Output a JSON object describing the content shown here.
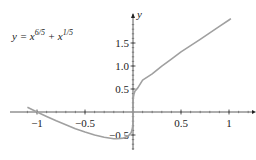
{
  "chart_data": {
    "type": "line",
    "title_parts": {
      "base": "y = x",
      "exp1": "6/5",
      "plus": " + x",
      "exp2": "1/5"
    },
    "xlabel": "",
    "ylabel": "y",
    "xlim": [
      -1.1,
      1.05
    ],
    "ylim": [
      -0.6,
      2.0
    ],
    "x_ticks": [
      -1,
      -0.5,
      0.5,
      1
    ],
    "x_tick_labels": [
      "−1",
      "−0.5",
      "0.5",
      "1"
    ],
    "y_ticks": [
      -0.5,
      0.5,
      1.0,
      1.5
    ],
    "y_tick_labels": [
      "−0.5",
      "0.5",
      "1.0",
      "1.5"
    ],
    "grid": false,
    "legend": null,
    "curve_color": "#a0a0a0",
    "axis_color": "#333333",
    "series": [
      {
        "name": "y = x^(6/5) + x^(1/5)",
        "x": [
          -1.1,
          -1.0,
          -0.9,
          -0.8,
          -0.7,
          -0.6,
          -0.5,
          -0.4,
          -0.3,
          -0.2,
          -0.1667,
          -0.1,
          -0.05,
          -0.02,
          -0.01,
          -0.003,
          -0.0005,
          0,
          0.0005,
          0.003,
          0.01,
          0.02,
          0.05,
          0.1,
          0.2,
          0.3,
          0.4,
          0.5,
          0.6,
          0.7,
          0.8,
          0.9,
          1.0,
          1.02
        ],
        "y": [
          0.102,
          0.0,
          -0.096,
          -0.191,
          -0.279,
          -0.364,
          -0.435,
          -0.499,
          -0.55,
          -0.58,
          -0.582,
          -0.568,
          -0.523,
          -0.452,
          -0.394,
          -0.312,
          -0.219,
          0,
          0.219,
          0.312,
          0.394,
          0.452,
          0.523,
          0.694,
          0.831,
          0.998,
          1.15,
          1.306,
          1.444,
          1.58,
          1.721,
          1.863,
          2.0,
          2.028
        ]
      }
    ]
  }
}
